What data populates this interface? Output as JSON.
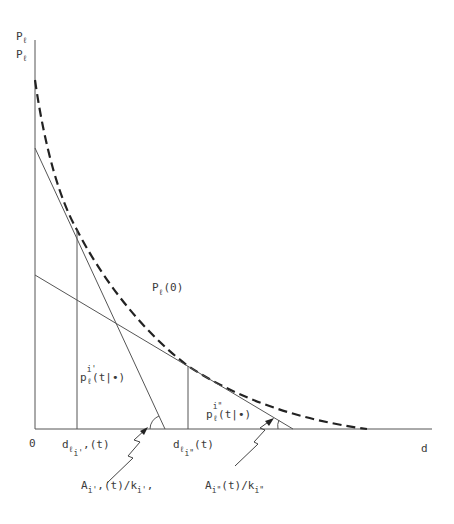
{
  "figure": {
    "type": "diagram",
    "axes": {
      "origin_label": "0",
      "x_label": "d",
      "y_label_top": "P",
      "y_label_top_sub": "ℓ",
      "y_label_bottom": "P",
      "y_label_bottom_sub": "ℓ"
    },
    "curve_label": {
      "main": "P",
      "sub": "ℓ",
      "rest": "(0)"
    },
    "tangent_1": {
      "price_label": {
        "main": "p",
        "sup": "i'",
        "sub": "ℓ",
        "rest": "(t|•)"
      },
      "tick_label": {
        "main": "d",
        "sub": "ℓ",
        "subsub": "i'",
        "rest": ",(t)"
      },
      "slope_label": {
        "main": "A",
        "sub1": "i'",
        "mid": ",(t)/k",
        "sub2": "i'",
        "rest": ","
      }
    },
    "tangent_2": {
      "price_label": {
        "main": "p",
        "sup": "i\"",
        "sub": "ℓ",
        "rest": "(t|•)"
      },
      "tick_label": {
        "main": "d",
        "sub": "ℓ",
        "subsub": "i\"",
        "rest": "(t)"
      },
      "slope_label": {
        "main": "A",
        "sub1": "i\"",
        "mid": "(t)/k",
        "sub2": "i\"",
        "rest": ""
      }
    },
    "colors": {
      "ink": "#3a3a3a",
      "curve": "#222222"
    }
  }
}
